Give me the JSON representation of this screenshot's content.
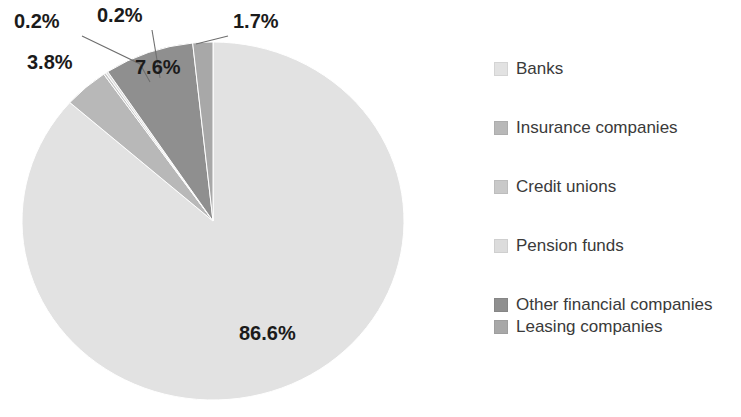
{
  "chart_data": {
    "type": "pie",
    "title": "",
    "subtitle": "",
    "xlabel": "",
    "ylabel": "",
    "legend_position": "right",
    "grid": false,
    "units": "percent",
    "start_angle_deg": 0,
    "direction": "clockwise",
    "categories": [
      "Banks",
      "Insurance companies",
      "Credit unions",
      "Pension funds",
      "Other financial companies",
      "Leasing companies"
    ],
    "values": [
      86.6,
      3.8,
      0.2,
      0.2,
      7.6,
      1.7
    ],
    "value_labels": [
      "86.6%",
      "3.8%",
      "0.2%",
      "0.2%",
      "7.6%",
      "1.7%"
    ],
    "colors": [
      "#e2e2e2",
      "#b8b8b8",
      "#c9c9c9",
      "#dcdcdc",
      "#8f8f8f",
      "#a8a8a8"
    ],
    "slices": [
      {
        "label": "Banks",
        "value": 86.6,
        "display": "86.6%",
        "color": "#e2e2e2"
      },
      {
        "label": "Insurance companies",
        "value": 3.8,
        "display": "3.8%",
        "color": "#b8b8b8"
      },
      {
        "label": "Credit unions",
        "value": 0.2,
        "display": "0.2%",
        "color": "#c9c9c9"
      },
      {
        "label": "Pension funds",
        "value": 0.2,
        "display": "0.2%",
        "color": "#dcdcdc"
      },
      {
        "label": "Other financial companies",
        "value": 7.6,
        "display": "7.6%",
        "color": "#8f8f8f"
      },
      {
        "label": "Leasing companies",
        "value": 1.7,
        "display": "1.7%",
        "color": "#a8a8a8"
      }
    ]
  },
  "data_labels": [
    {
      "text": "0.2%"
    },
    {
      "text": "0.2%"
    },
    {
      "text": "1.7%"
    },
    {
      "text": "3.8%"
    },
    {
      "text": "7.6%"
    },
    {
      "text": "86.6%"
    }
  ],
  "legend": {
    "items": [
      {
        "label": "Banks",
        "color": "#e2e2e2",
        "swatch_name": "legend-swatch-banks"
      },
      {
        "label": "Insurance companies",
        "color": "#b8b8b8",
        "swatch_name": "legend-swatch-insurance-companies"
      },
      {
        "label": "Credit unions",
        "color": "#c9c9c9",
        "swatch_name": "legend-swatch-credit-unions"
      },
      {
        "label": "Pension funds",
        "color": "#dcdcdc",
        "swatch_name": "legend-swatch-pension-funds"
      },
      {
        "label": "Other financial companies",
        "color": "#8f8f8f",
        "swatch_name": "legend-swatch-other-financial-companies"
      },
      {
        "label": "Leasing companies",
        "color": "#a8a8a8",
        "swatch_name": "legend-swatch-leasing-companies"
      }
    ]
  },
  "style": {
    "background": "#ffffff",
    "label_color": "#1b1b1b",
    "legend_text_color": "#3a3a3a",
    "leader_line_color": "#6e6e6e"
  }
}
